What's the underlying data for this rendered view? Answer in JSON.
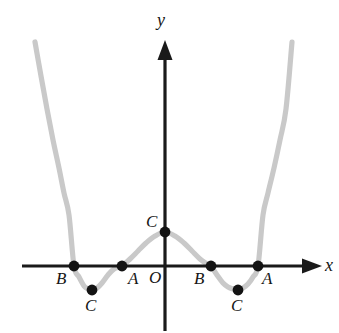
{
  "figure": {
    "title": "",
    "background_color": "#ffffff",
    "curve_color": "#c9c9c9",
    "axis_color": "#1a1a1a",
    "marker_color": "#131313"
  },
  "axes": {
    "x_axis": {
      "label": "x",
      "label_x": 325,
      "label_y": 271,
      "y_pixel": 266,
      "x_start": 22,
      "x_end": 322,
      "arrow": "right"
    },
    "y_axis": {
      "label": "y",
      "label_x": 157,
      "label_y": 26,
      "x_pixel": 165,
      "y_start": 40,
      "y_end": 331,
      "arrow": "up"
    },
    "origin_label": "O",
    "origin_label_x": 149,
    "origin_label_y": 283
  },
  "points": [
    {
      "label": "B",
      "x": 74,
      "y": 266,
      "label_x": 56,
      "label_y": 284
    },
    {
      "label": "A",
      "x": 122,
      "y": 266,
      "label_x": 128,
      "label_y": 284
    },
    {
      "label": "C",
      "x": 165,
      "y": 232,
      "label_x": 146,
      "label_y": 227
    },
    {
      "label": "B",
      "x": 211,
      "y": 266,
      "label_x": 194,
      "label_y": 284
    },
    {
      "label": "A",
      "x": 258,
      "y": 266,
      "label_x": 262,
      "label_y": 284
    },
    {
      "label": "C",
      "x": 92,
      "y": 290,
      "label_x": 85,
      "label_y": 311
    },
    {
      "label": "C",
      "x": 238,
      "y": 290,
      "label_x": 231,
      "label_y": 311
    }
  ],
  "chart_data": {
    "type": "line",
    "title": "",
    "xlabel": "x",
    "ylabel": "y",
    "grid": false,
    "legend": "none",
    "axis_origin_pixel": [
      165,
      266
    ],
    "xlim_pixels": [
      22,
      322
    ],
    "ylim_pixels": [
      40,
      331
    ],
    "marked_points": {
      "labels": [
        "B",
        "A",
        "C",
        "B",
        "A",
        "C",
        "C"
      ],
      "pixel_x": [
        74,
        122,
        165,
        211,
        258,
        92,
        238
      ],
      "pixel_y": [
        266,
        266,
        232,
        266,
        266,
        290,
        290
      ],
      "kinds": [
        "x-intercept",
        "x-intercept",
        "y-intercept-local-max",
        "x-intercept",
        "x-intercept",
        "local-min",
        "local-min"
      ]
    },
    "curve_pixels": {
      "comment": "Sampled pixel coordinates along the plotted gray curve, left to right.",
      "x": [
        35,
        41,
        47,
        53,
        59,
        64,
        69,
        74,
        79,
        84,
        88,
        92,
        97,
        102,
        108,
        114,
        122,
        130,
        138,
        146,
        155,
        165,
        175,
        184,
        192,
        200,
        207,
        211,
        217,
        223,
        228,
        233,
        238,
        243,
        248,
        253,
        258,
        263,
        268,
        274,
        280,
        286,
        292
      ],
      "y": [
        42,
        76,
        109,
        140,
        168,
        193,
        215,
        266,
        277,
        286,
        289,
        290,
        288,
        283,
        275,
        269,
        266,
        259,
        251,
        243,
        236,
        232,
        236,
        243,
        251,
        259,
        264,
        266,
        275,
        283,
        287,
        289,
        290,
        288,
        284,
        277,
        266,
        215,
        193,
        168,
        140,
        109,
        42
      ]
    }
  }
}
